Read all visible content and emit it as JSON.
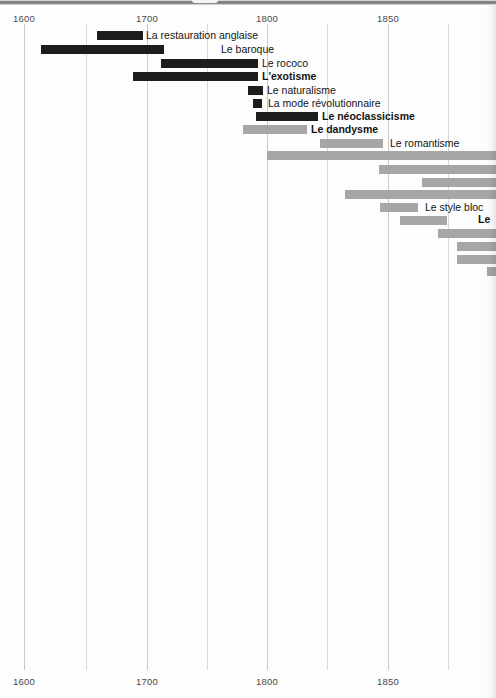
{
  "chart_data": {
    "type": "bar",
    "orientation": "horizontal-timeline",
    "title": "",
    "xlabel": "",
    "ylabel": "",
    "xlim": [
      1580,
      1967
    ],
    "grid": true,
    "legend_position": "none",
    "axis": {
      "tick_labels_top": [
        "1600",
        "1700",
        "1800",
        "1850"
      ],
      "tick_labels_bottom": [
        "1600",
        "1700",
        "1800",
        "1850"
      ],
      "tick_values": [
        1600,
        1700,
        1800,
        1850
      ],
      "gridline_values": [
        1600,
        1650,
        1700,
        1750,
        1800,
        1850,
        1900,
        1950
      ],
      "minor_gridlines": [
        1650,
        1750,
        1900,
        1950
      ]
    },
    "colors": {
      "dark_bar": "#1d1d1d",
      "light_bar": "#a6a6a6",
      "gridline": "#d7d7d7",
      "label_text": "#141414",
      "tick_text": "#4a4a4a",
      "background": "#fdfdfd"
    },
    "series": [
      {
        "label": "La restauration anglaise",
        "start": 1660,
        "end": 1697,
        "color": "dark",
        "label_side": "right",
        "label_bold": false
      },
      {
        "label": "Le baroque",
        "start": 1614,
        "end": 1714,
        "color": "dark",
        "label_side": "right",
        "label_bold": false
      },
      {
        "label": "Le rococo",
        "start": 1712,
        "end": 1791,
        "color": "dark",
        "label_side": "right",
        "label_bold": false
      },
      {
        "label": "L'exotisme",
        "start": 1689,
        "end": 1791,
        "color": "dark",
        "label_side": "right",
        "label_bold": true
      },
      {
        "label": "Le naturalisme",
        "start": 1783,
        "end": 1795,
        "color": "dark",
        "label_side": "right",
        "label_bold": false
      },
      {
        "label": "La mode révolutionnaire",
        "start": 1788,
        "end": 1795,
        "color": "dark",
        "label_side": "right",
        "label_bold": false
      },
      {
        "label": "Le néoclassicisme",
        "start": 1790,
        "end": 1841,
        "color": "dark",
        "label_side": "right",
        "label_bold": true
      },
      {
        "label": "Le dandysme",
        "start": 1780,
        "end": 1832,
        "color": "light",
        "label_side": "right",
        "label_bold": true
      },
      {
        "label": "Le romantisme",
        "start": 1843,
        "end": 1894,
        "color": "light",
        "label_side": "right",
        "label_bold": false
      },
      {
        "label": "",
        "start": 1799,
        "end": 1967,
        "color": "light",
        "label_side": "right",
        "label_bold": false
      },
      {
        "label": "",
        "start": 1891,
        "end": 1967,
        "color": "light",
        "label_side": "right",
        "label_bold": false
      },
      {
        "label": "",
        "start": 1927,
        "end": 1967,
        "color": "light",
        "label_side": "right",
        "label_bold": false
      },
      {
        "label": "",
        "start": 1863,
        "end": 1967,
        "color": "light",
        "label_side": "right",
        "label_bold": false
      },
      {
        "label": "Le style bloc",
        "start": 1892,
        "end": 1923,
        "color": "light",
        "label_side": "right",
        "label_bold": false
      },
      {
        "label": "Le",
        "start": 1909,
        "end": 1948,
        "color": "light",
        "label_side": "right",
        "label_bold": true
      },
      {
        "label": "",
        "start": 1957,
        "end": 1967,
        "color": "light",
        "label_side": "right",
        "label_bold": false
      },
      {
        "label": "",
        "start": 1973,
        "end": 1967,
        "color": "light",
        "label_side": "right",
        "label_bold": false
      },
      {
        "label": "",
        "start": 1973,
        "end": 1967,
        "color": "light",
        "label_side": "right",
        "label_bold": false
      },
      {
        "label": "",
        "start": 1997,
        "end": 1967,
        "color": "light",
        "label_side": "right",
        "label_bold": false
      }
    ],
    "bar_pixel_geometry": [
      {
        "x": 97,
        "w": 46,
        "y": 31,
        "color": "dark",
        "label": "La restauration anglaise",
        "label_x": 146,
        "label_y": 31,
        "bold": false
      },
      {
        "x": 41,
        "w": 123,
        "y": 45,
        "color": "dark",
        "label": "Le baroque",
        "label_x": 221,
        "label_y": 45,
        "bold": false
      },
      {
        "x": 161,
        "w": 97,
        "y": 59,
        "color": "dark",
        "label": "Le rococo",
        "label_x": 262,
        "label_y": 59,
        "bold": false
      },
      {
        "x": 133,
        "w": 125,
        "y": 72,
        "color": "dark",
        "label": "L'exotisme",
        "label_x": 262,
        "label_y": 72,
        "bold": true
      },
      {
        "x": 248,
        "w": 15,
        "y": 86,
        "color": "dark",
        "label": "Le naturalisme",
        "label_x": 267,
        "label_y": 86,
        "bold": false
      },
      {
        "x": 253,
        "w": 9,
        "y": 99,
        "color": "dark",
        "label": "La mode révolutionnaire",
        "label_x": 268,
        "label_y": 99,
        "bold": false
      },
      {
        "x": 256,
        "w": 62,
        "y": 112,
        "color": "dark",
        "label": "Le néoclassicisme",
        "label_x": 322,
        "label_y": 112,
        "bold": true
      },
      {
        "x": 243,
        "w": 64,
        "y": 125,
        "color": "light",
        "label": "Le dandysme",
        "label_x": 311,
        "label_y": 125,
        "bold": true
      },
      {
        "x": 320,
        "w": 63,
        "y": 139,
        "color": "light",
        "label": "Le romantisme",
        "label_x": 390,
        "label_y": 139,
        "bold": false
      },
      {
        "x": 267,
        "w": 229,
        "y": 151,
        "color": "light",
        "label": "",
        "label_x": 0,
        "label_y": 0,
        "bold": false
      },
      {
        "x": 379,
        "w": 117,
        "y": 165,
        "color": "light",
        "label": "",
        "label_x": 0,
        "label_y": 0,
        "bold": false
      },
      {
        "x": 422,
        "w": 74,
        "y": 178,
        "color": "light",
        "label": "",
        "label_x": 0,
        "label_y": 0,
        "bold": false
      },
      {
        "x": 345,
        "w": 151,
        "y": 190,
        "color": "light",
        "label": "",
        "label_x": 0,
        "label_y": 0,
        "bold": false
      },
      {
        "x": 380,
        "w": 38,
        "y": 203,
        "color": "light",
        "label": "Le style bloc",
        "label_x": 425,
        "label_y": 203,
        "bold": false
      },
      {
        "x": 400,
        "w": 47,
        "y": 216,
        "color": "light",
        "label": "Le",
        "label_x": 478,
        "label_y": 215,
        "bold": true
      },
      {
        "x": 438,
        "w": 58,
        "y": 229,
        "color": "light",
        "label": "",
        "label_x": 0,
        "label_y": 0,
        "bold": false
      },
      {
        "x": 457,
        "w": 39,
        "y": 242,
        "color": "light",
        "label": "",
        "label_x": 0,
        "label_y": 0,
        "bold": false
      },
      {
        "x": 457,
        "w": 39,
        "y": 255,
        "color": "light",
        "label": "",
        "label_x": 0,
        "label_y": 0,
        "bold": false
      },
      {
        "x": 487,
        "w": 9,
        "y": 267,
        "color": "light",
        "label": "",
        "label_x": 0,
        "label_y": 0,
        "bold": false
      }
    ],
    "gridline_pixel_x": [
      24,
      86,
      147,
      207,
      267,
      327,
      388,
      448
    ],
    "gridline_major_index": [
      0,
      2,
      4,
      6
    ],
    "tick_pixel": [
      {
        "label": "1600",
        "x": 24
      },
      {
        "label": "1700",
        "x": 147
      },
      {
        "label": "1800",
        "x": 267
      },
      {
        "label": "1850",
        "x": 388
      }
    ]
  }
}
